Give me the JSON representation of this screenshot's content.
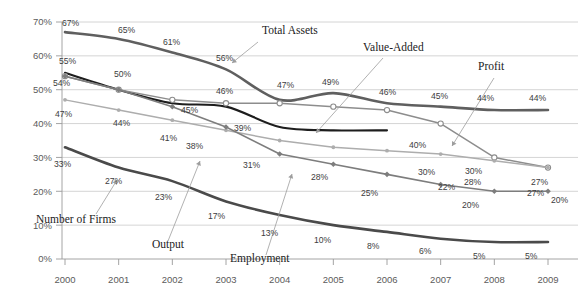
{
  "chart_data": {
    "type": "line",
    "title": "",
    "subtitle": "",
    "xlabel": "",
    "ylabel": "",
    "xlim": [
      2000,
      2009
    ],
    "ylim": [
      0,
      70
    ],
    "grid": true,
    "legend_position": "inline-annotations",
    "x": [
      2000,
      2001,
      2002,
      2003,
      2004,
      2005,
      2006,
      2007,
      2008,
      2009
    ],
    "categories": [
      "2000",
      "2001",
      "2002",
      "2003",
      "2004",
      "2005",
      "2006",
      "2007",
      "2008",
      "2009"
    ],
    "ytick_labels": [
      "0%",
      "10%",
      "20%",
      "30%",
      "40%",
      "50%",
      "60%",
      "70%"
    ],
    "ytick_values": [
      0,
      10,
      20,
      30,
      40,
      50,
      60,
      70
    ],
    "series": [
      {
        "name": "Total Assets",
        "color": "#5f5f5f",
        "width": 2.6,
        "marker": "none",
        "values": [
          67,
          65,
          61,
          56,
          47,
          49,
          46,
          45,
          44,
          44
        ],
        "labels": [
          "67%",
          "65%",
          "61%",
          "56%",
          "47%",
          "49%",
          "46%",
          "45%",
          "44%",
          "44%"
        ]
      },
      {
        "name": "Value-Added",
        "color": "#1d1d1d",
        "width": 2.1,
        "marker": "none",
        "values": [
          55,
          50,
          46,
          45,
          39,
          38,
          38,
          null,
          null,
          null
        ],
        "labels": [
          "55%",
          "50%",
          "46%",
          "45%",
          "39%",
          "38%",
          "",
          "",
          "",
          ""
        ]
      },
      {
        "name": "Profit",
        "color": "#8d8d8d",
        "width": 1.5,
        "marker": "circle-open",
        "values": [
          54,
          50,
          47,
          46,
          46,
          45,
          44,
          40,
          30,
          27
        ],
        "labels": [
          "54%",
          "",
          "",
          "",
          "",
          "",
          "",
          "40%",
          "30%",
          "27%"
        ]
      },
      {
        "name": "Light Gray Series",
        "color": "#adadad",
        "width": 1.5,
        "marker": "circle-small",
        "values": [
          47,
          44,
          41,
          38,
          35,
          33,
          32,
          31,
          29,
          27
        ],
        "labels": [
          "47%",
          "44%",
          "41%",
          "38%",
          "",
          "",
          "",
          "",
          "",
          "27%"
        ]
      },
      {
        "name": "Employment",
        "color": "#7d7d7d",
        "width": 1.6,
        "marker": "diamond",
        "values": [
          54,
          50,
          45,
          39,
          31,
          28,
          25,
          22,
          20,
          20
        ],
        "labels": [
          "",
          "",
          "45%",
          "39%",
          "31%",
          "28%",
          "25%",
          "22%",
          "20%",
          "20%"
        ]
      },
      {
        "name": "Number of Firms",
        "color": "#4a4a4a",
        "width": 2.6,
        "marker": "none",
        "values": [
          33,
          27,
          23,
          17,
          13,
          10,
          8,
          6,
          5,
          5
        ],
        "labels": [
          "33%",
          "27%",
          "23%",
          "17%",
          "13%",
          "10%",
          "8%",
          "6%",
          "5%",
          "5%"
        ]
      }
    ],
    "annotations": [
      {
        "text": "Total Assets",
        "x": 262,
        "y": 34
      },
      {
        "text": "Value-Added",
        "x": 363,
        "y": 51
      },
      {
        "text": "Profit",
        "x": 478,
        "y": 70
      },
      {
        "text": "Number of Firms",
        "x": 36,
        "y": 223
      },
      {
        "text": "Output",
        "x": 152,
        "y": 248
      },
      {
        "text": "Employment",
        "x": 230,
        "y": 262
      }
    ],
    "data_labels": [
      {
        "text": "67%",
        "x": 62,
        "y": 26
      },
      {
        "text": "65%",
        "x": 118,
        "y": 33
      },
      {
        "text": "61%",
        "x": 163,
        "y": 45
      },
      {
        "text": "56%",
        "x": 216,
        "y": 61
      },
      {
        "text": "47%",
        "x": 277,
        "y": 88
      },
      {
        "text": "49%",
        "x": 322,
        "y": 85
      },
      {
        "text": "46%",
        "x": 379,
        "y": 95
      },
      {
        "text": "45%",
        "x": 431,
        "y": 99
      },
      {
        "text": "44%",
        "x": 477,
        "y": 101
      },
      {
        "text": "44%",
        "x": 529,
        "y": 101
      },
      {
        "text": "55%",
        "x": 59,
        "y": 64
      },
      {
        "text": "50%",
        "x": 114,
        "y": 77
      },
      {
        "text": "46%",
        "x": 216,
        "y": 94
      },
      {
        "text": "45%",
        "x": 181,
        "y": 113
      },
      {
        "text": "39%",
        "x": 234,
        "y": 131
      },
      {
        "text": "38%",
        "x": 186,
        "y": 149
      },
      {
        "text": "54%",
        "x": 53,
        "y": 86
      },
      {
        "text": "47%",
        "x": 55,
        "y": 117
      },
      {
        "text": "44%",
        "x": 113,
        "y": 126
      },
      {
        "text": "41%",
        "x": 160,
        "y": 141
      },
      {
        "text": "40%",
        "x": 409,
        "y": 148
      },
      {
        "text": "30%",
        "x": 465,
        "y": 174
      },
      {
        "text": "27%",
        "x": 531,
        "y": 185
      },
      {
        "text": "31%",
        "x": 243,
        "y": 168
      },
      {
        "text": "28%",
        "x": 311,
        "y": 180
      },
      {
        "text": "25%",
        "x": 361,
        "y": 196
      },
      {
        "text": "30%",
        "x": 418,
        "y": 175
      },
      {
        "text": "28%",
        "x": 464,
        "y": 185
      },
      {
        "text": "22%",
        "x": 438,
        "y": 190
      },
      {
        "text": "20%",
        "x": 462,
        "y": 208
      },
      {
        "text": "27%",
        "x": 527,
        "y": 196
      },
      {
        "text": "20%",
        "x": 551,
        "y": 203
      },
      {
        "text": "33%",
        "x": 54,
        "y": 167
      },
      {
        "text": "27%",
        "x": 105,
        "y": 184
      },
      {
        "text": "23%",
        "x": 155,
        "y": 200
      },
      {
        "text": "17%",
        "x": 208,
        "y": 219
      },
      {
        "text": "13%",
        "x": 261,
        "y": 236
      },
      {
        "text": "10%",
        "x": 314,
        "y": 243
      },
      {
        "text": "8%",
        "x": 367,
        "y": 249
      },
      {
        "text": "6%",
        "x": 419,
        "y": 254
      },
      {
        "text": "5%",
        "x": 473,
        "y": 259
      },
      {
        "text": "5%",
        "x": 525,
        "y": 259
      }
    ]
  }
}
